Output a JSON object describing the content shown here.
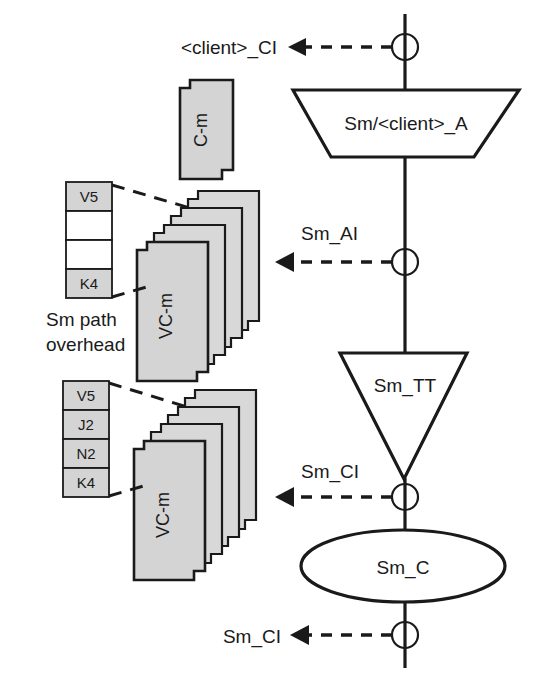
{
  "diagram": {
    "colors": {
      "line": "#1a1a1a",
      "packet_fill": "#d4d4d4",
      "overhead_fill": "#d4d4d4",
      "background": "#ffffff"
    },
    "trail_labels": [
      {
        "id": "client-ci",
        "text": "<client>_CI"
      },
      {
        "id": "sm-ai",
        "text": "Sm_AI"
      },
      {
        "id": "sm-ci-upper",
        "text": "Sm_CI"
      },
      {
        "id": "sm-ci-lower",
        "text": "Sm_CI"
      }
    ],
    "nodes": [
      {
        "id": "adaptation",
        "shape": "trapezoid",
        "text": "Sm/<client>_A"
      },
      {
        "id": "termination",
        "shape": "inverted-triangle",
        "text": "Sm_TT"
      },
      {
        "id": "connection",
        "shape": "ellipse",
        "text": "Sm_C"
      }
    ],
    "packets": [
      {
        "id": "c-m",
        "text": "C-m",
        "count": 1
      },
      {
        "id": "vc-m-upper",
        "text": "VC-m",
        "count": 4
      },
      {
        "id": "vc-m-lower",
        "text": "VC-m",
        "count": 4
      }
    ],
    "overhead_caption": {
      "line1": "Sm path",
      "line2": "overhead"
    },
    "overhead_upper": {
      "id": "overhead-upper",
      "cells": [
        {
          "label": "V5",
          "filled": true
        },
        {
          "label": "",
          "filled": false
        },
        {
          "label": "",
          "filled": false
        },
        {
          "label": "K4",
          "filled": true
        }
      ]
    },
    "overhead_lower": {
      "id": "overhead-lower",
      "cells": [
        {
          "label": "V5",
          "filled": true
        },
        {
          "label": "J2",
          "filled": true
        },
        {
          "label": "N2",
          "filled": true
        },
        {
          "label": "K4",
          "filled": true
        }
      ]
    }
  }
}
